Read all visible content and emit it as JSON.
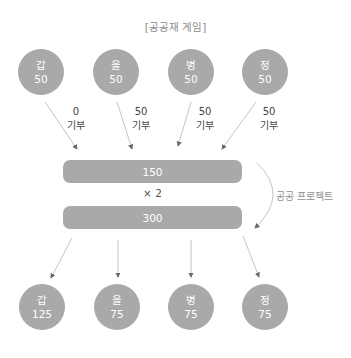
{
  "title": "[공공재 게임]",
  "players_before": [
    {
      "name": "갑",
      "value": "50"
    },
    {
      "name": "을",
      "value": "50"
    },
    {
      "name": "병",
      "value": "50"
    },
    {
      "name": "정",
      "value": "50"
    }
  ],
  "contributions": [
    {
      "amount": "0",
      "label": "기부"
    },
    {
      "amount": "50",
      "label": "기부"
    },
    {
      "amount": "50",
      "label": "기부"
    },
    {
      "amount": "50",
      "label": "기부"
    }
  ],
  "pool": {
    "total": "150",
    "multiplier": "× 2",
    "result": "300"
  },
  "project_label": "공공 프로젝트",
  "players_after": [
    {
      "name": "갑",
      "value": "125"
    },
    {
      "name": "을",
      "value": "75"
    },
    {
      "name": "병",
      "value": "75"
    },
    {
      "name": "정",
      "value": "75"
    }
  ],
  "colors": {
    "node": "#a9a9a9",
    "arrow": "#b5b5b5",
    "text_light": "#ffffff"
  }
}
